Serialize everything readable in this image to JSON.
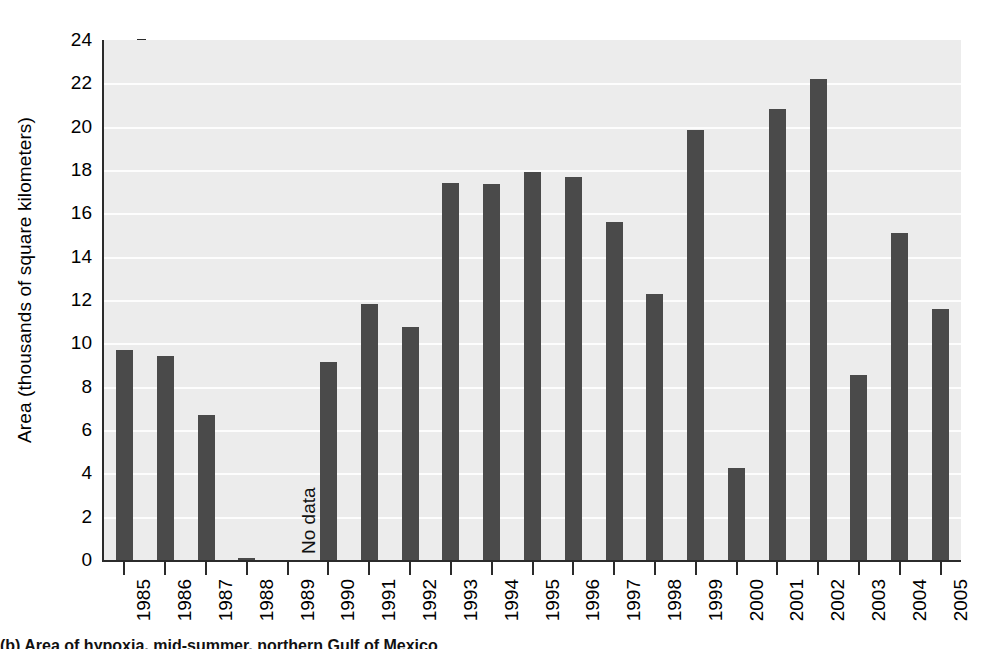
{
  "chart_data": {
    "type": "bar",
    "title": "",
    "xlabel": "",
    "ylabel": "Area (thousands of square kilometers)",
    "ylim": [
      0,
      24
    ],
    "ytick_step": 2,
    "yticks": [
      0,
      2,
      4,
      6,
      8,
      10,
      12,
      14,
      16,
      18,
      20,
      22,
      24
    ],
    "grid": "horizontal",
    "legend": "none",
    "categories": [
      "1985",
      "1986",
      "1987",
      "1988",
      "1989",
      "1990",
      "1991",
      "1992",
      "1993",
      "1994",
      "1995",
      "1996",
      "1997",
      "1998",
      "1999",
      "2000",
      "2001",
      "2002",
      "2003",
      "2004",
      "2005"
    ],
    "values": [
      9.7,
      9.4,
      6.7,
      0.1,
      null,
      9.15,
      11.8,
      10.75,
      17.4,
      17.35,
      17.9,
      17.7,
      15.6,
      12.3,
      19.85,
      4.25,
      20.8,
      22.2,
      8.55,
      15.1,
      11.6
    ],
    "annotations": [
      {
        "text": "No data",
        "category": "1989",
        "orientation": "vertical"
      }
    ],
    "colors": {
      "bar": "#4a4a4a",
      "plot_background": "#ececec",
      "gridline": "#fdfdfd",
      "axis": "#2b2b2b",
      "text": "#000000",
      "page_background": "#ffffff"
    }
  },
  "caption": {
    "text": "(b) Area of hypoxia, mid-summer, northern Gulf of Mexico"
  }
}
